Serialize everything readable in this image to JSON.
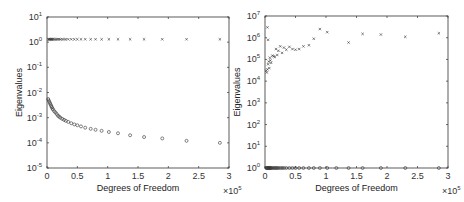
{
  "chart_data": [
    {
      "type": "scatter",
      "title": "",
      "xlabel": "Degrees of Freedom",
      "ylabel": "Eigenvalues",
      "x_multiplier": "×10^5",
      "xlim": [
        0,
        3
      ],
      "ylim_log10": [
        -5,
        1
      ],
      "yscale": "log",
      "xticks": [
        "0",
        "0.5",
        "1",
        "1.5",
        "2",
        "2.5",
        "3"
      ],
      "yticks": [
        "10^-5",
        "10^-4",
        "10^-3",
        "10^-2",
        "10^-1",
        "10^0",
        "10^1"
      ],
      "grid": false,
      "series": [
        {
          "name": "upper (x markers)",
          "marker": "x",
          "x": [
            0.02,
            0.03,
            0.04,
            0.05,
            0.06,
            0.07,
            0.08,
            0.09,
            0.1,
            0.12,
            0.14,
            0.16,
            0.18,
            0.2,
            0.22,
            0.25,
            0.28,
            0.31,
            0.35,
            0.4,
            0.45,
            0.5,
            0.56,
            0.63,
            0.72,
            0.8,
            0.9,
            1.02,
            1.17,
            1.37,
            1.6,
            1.9,
            2.3,
            2.85
          ],
          "y": [
            1.3,
            1.3,
            1.3,
            1.3,
            1.3,
            1.3,
            1.3,
            1.3,
            1.3,
            1.3,
            1.3,
            1.3,
            1.3,
            1.3,
            1.3,
            1.3,
            1.3,
            1.3,
            1.3,
            1.3,
            1.3,
            1.3,
            1.3,
            1.3,
            1.3,
            1.3,
            1.3,
            1.3,
            1.3,
            1.3,
            1.3,
            1.3,
            1.3,
            1.3
          ]
        },
        {
          "name": "lower (o markers)",
          "marker": "o",
          "x": [
            0.02,
            0.03,
            0.04,
            0.05,
            0.06,
            0.07,
            0.08,
            0.09,
            0.1,
            0.12,
            0.14,
            0.16,
            0.18,
            0.2,
            0.22,
            0.25,
            0.28,
            0.31,
            0.35,
            0.4,
            0.45,
            0.5,
            0.56,
            0.63,
            0.72,
            0.8,
            0.9,
            1.02,
            1.17,
            1.37,
            1.6,
            1.9,
            2.3,
            2.85
          ],
          "y": [
            0.0055,
            0.0048,
            0.0042,
            0.0037,
            0.0033,
            0.0029,
            0.0026,
            0.0023,
            0.0021,
            0.0018,
            0.0016,
            0.0014,
            0.0012,
            0.0011,
            0.001,
            0.0009,
            0.00082,
            0.00075,
            0.00068,
            0.0006,
            0.00054,
            0.0005,
            0.00045,
            0.0004,
            0.00036,
            0.00033,
            0.0003,
            0.00027,
            0.00024,
            0.0002,
            0.00017,
            0.00015,
            0.00012,
            0.0001
          ]
        }
      ]
    },
    {
      "type": "scatter",
      "title": "",
      "xlabel": "Degrees of Freedom",
      "ylabel": "Eigenvalues",
      "x_multiplier": "×10^5",
      "xlim": [
        0,
        3
      ],
      "ylim_log10": [
        0,
        7
      ],
      "yscale": "log",
      "xticks": [
        "0",
        "0.5",
        "1",
        "1.5",
        "2",
        "2.5",
        "3"
      ],
      "yticks": [
        "10^0",
        "10^1",
        "10^2",
        "10^3",
        "10^4",
        "10^5",
        "10^6",
        "10^7"
      ],
      "grid": false,
      "series": [
        {
          "name": "upper (x markers)",
          "marker": "x",
          "x": [
            0.02,
            0.03,
            0.04,
            0.05,
            0.06,
            0.07,
            0.08,
            0.09,
            0.1,
            0.12,
            0.14,
            0.16,
            0.18,
            0.2,
            0.22,
            0.25,
            0.28,
            0.31,
            0.35,
            0.4,
            0.45,
            0.5,
            0.56,
            0.63,
            0.72,
            0.8,
            0.9,
            1.02,
            1.37,
            1.6,
            1.9,
            2.3,
            2.85,
            0.04,
            0.05
          ],
          "y": [
            30000,
            25000,
            35000,
            60000,
            80000,
            40000,
            120000,
            90000,
            70000,
            150000,
            140000,
            130000,
            300000,
            160000,
            250000,
            400000,
            200000,
            350000,
            280000,
            380000,
            300000,
            280000,
            300000,
            400000,
            450000,
            900000,
            2500000,
            1800000,
            600000,
            1500000,
            1400000,
            1100000,
            1600000,
            3000000,
            800000
          ]
        },
        {
          "name": "lower (o markers)",
          "marker": "o",
          "x": [
            0.02,
            0.03,
            0.04,
            0.05,
            0.06,
            0.07,
            0.08,
            0.09,
            0.1,
            0.12,
            0.14,
            0.16,
            0.18,
            0.2,
            0.22,
            0.25,
            0.28,
            0.31,
            0.35,
            0.4,
            0.45,
            0.5,
            0.56,
            0.63,
            0.72,
            0.8,
            0.9,
            1.02,
            1.17,
            1.37,
            1.6,
            1.9,
            2.3,
            2.85
          ],
          "y": [
            1,
            1,
            1,
            1,
            1,
            1,
            1,
            1,
            1,
            1,
            1,
            1,
            1,
            1,
            1,
            1,
            1,
            1,
            1,
            1,
            1,
            1,
            1,
            1,
            1,
            1,
            1,
            1,
            1,
            1,
            1,
            1,
            1,
            1
          ]
        }
      ]
    }
  ],
  "panels": [
    {
      "frame": {
        "left": 47,
        "top": 17,
        "right": 229,
        "bottom": 168
      }
    },
    {
      "frame": {
        "left": 265,
        "top": 16,
        "right": 448,
        "bottom": 168
      }
    }
  ],
  "colors": {
    "axis": "#333333",
    "marker": "#333333",
    "background": "#ffffff"
  }
}
